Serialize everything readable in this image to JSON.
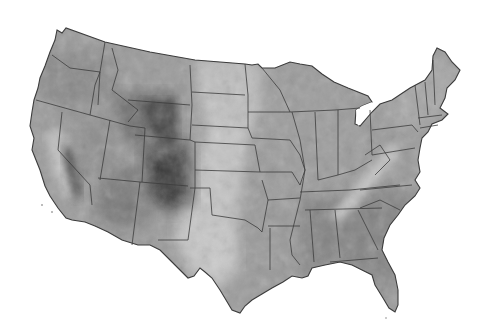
{
  "map": {
    "subject": "Contiguous United States",
    "style": "grayscale shaded relief with state boundaries",
    "colors": {
      "background": "#ffffff",
      "land_base": "#9a9a9a",
      "plains_light": "#c4c4c4",
      "east_mid": "#8c8c8c",
      "mountains_dark": "#3a3a3a",
      "southeast": "#7e7e7e",
      "border": "#3c3c3c"
    },
    "labels": []
  }
}
